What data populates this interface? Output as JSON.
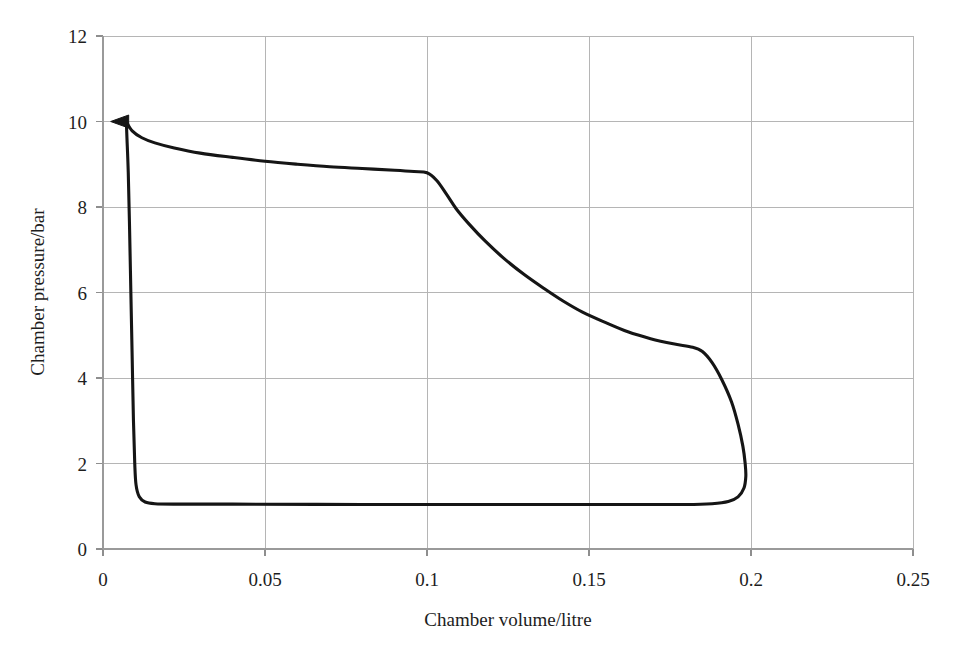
{
  "chart_data": {
    "type": "line",
    "title": "",
    "xlabel": "Chamber volume/litre",
    "ylabel": "Chamber pressure/bar",
    "xlim": [
      0,
      0.25
    ],
    "ylim": [
      0,
      12
    ],
    "xticks": [
      0,
      0.05,
      0.1,
      0.15,
      0.2,
      0.25
    ],
    "xtick_labels": [
      "0",
      "0.05",
      "0.1",
      "0.15",
      "0.2",
      "0.25"
    ],
    "yticks": [
      0,
      2,
      4,
      6,
      8,
      10,
      12
    ],
    "ytick_labels": [
      "0",
      "2",
      "4",
      "6",
      "8",
      "10",
      "12"
    ],
    "grid": true,
    "legend": null,
    "annotations": [
      {
        "name": "cycle-direction-arrow",
        "shape": "triangle-left",
        "x": 0.007,
        "y": 10.0
      }
    ],
    "series": [
      {
        "name": "pressure-volume-cycle",
        "closed": true,
        "color": "#151515",
        "points": [
          [
            0.0072,
            10.0
          ],
          [
            0.009,
            9.78
          ],
          [
            0.012,
            9.62
          ],
          [
            0.016,
            9.5
          ],
          [
            0.022,
            9.38
          ],
          [
            0.03,
            9.26
          ],
          [
            0.04,
            9.16
          ],
          [
            0.05,
            9.07
          ],
          [
            0.06,
            9.0
          ],
          [
            0.07,
            8.94
          ],
          [
            0.08,
            8.9
          ],
          [
            0.09,
            8.86
          ],
          [
            0.096,
            8.83
          ],
          [
            0.1,
            8.8
          ],
          [
            0.103,
            8.62
          ],
          [
            0.106,
            8.3
          ],
          [
            0.109,
            7.96
          ],
          [
            0.113,
            7.6
          ],
          [
            0.118,
            7.2
          ],
          [
            0.124,
            6.78
          ],
          [
            0.13,
            6.42
          ],
          [
            0.136,
            6.1
          ],
          [
            0.142,
            5.8
          ],
          [
            0.148,
            5.54
          ],
          [
            0.155,
            5.3
          ],
          [
            0.162,
            5.08
          ],
          [
            0.169,
            4.92
          ],
          [
            0.176,
            4.8
          ],
          [
            0.182,
            4.72
          ],
          [
            0.185,
            4.62
          ],
          [
            0.188,
            4.36
          ],
          [
            0.191,
            3.96
          ],
          [
            0.194,
            3.44
          ],
          [
            0.196,
            2.92
          ],
          [
            0.1975,
            2.4
          ],
          [
            0.1982,
            2.0
          ],
          [
            0.1984,
            1.7
          ],
          [
            0.1978,
            1.42
          ],
          [
            0.196,
            1.22
          ],
          [
            0.193,
            1.11
          ],
          [
            0.188,
            1.06
          ],
          [
            0.18,
            1.04
          ],
          [
            0.16,
            1.04
          ],
          [
            0.12,
            1.04
          ],
          [
            0.08,
            1.04
          ],
          [
            0.04,
            1.05
          ],
          [
            0.022,
            1.05
          ],
          [
            0.016,
            1.06
          ],
          [
            0.013,
            1.1
          ],
          [
            0.0112,
            1.22
          ],
          [
            0.0102,
            1.5
          ],
          [
            0.0098,
            2.0
          ],
          [
            0.0094,
            3.0
          ],
          [
            0.009,
            4.5
          ],
          [
            0.0086,
            6.0
          ],
          [
            0.0082,
            7.5
          ],
          [
            0.0078,
            8.8
          ],
          [
            0.0074,
            9.6
          ],
          [
            0.0072,
            10.0
          ]
        ]
      }
    ]
  }
}
